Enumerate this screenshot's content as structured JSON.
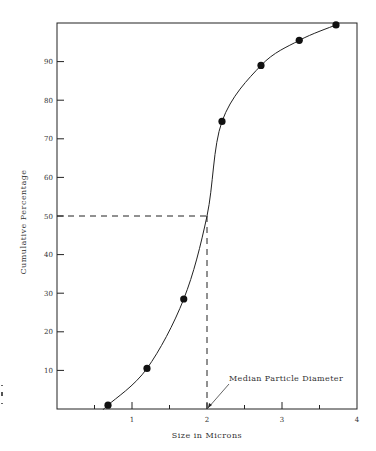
{
  "chart_data": {
    "type": "line",
    "title": "",
    "xlabel": "Size in Microns",
    "ylabel": "Cumulative Percentage",
    "xlim": [
      0,
      4
    ],
    "ylim": [
      0,
      100
    ],
    "x_ticks": [
      1,
      2,
      3,
      4
    ],
    "x_minor_ticks": [
      0.5,
      1.5,
      2.5,
      3.5
    ],
    "y_ticks": [
      10,
      20,
      30,
      40,
      50,
      60,
      70,
      80,
      90
    ],
    "grid": false,
    "legend": null,
    "series": [
      {
        "name": "Cumulative distribution",
        "style": "smooth curve with filled circle markers",
        "x": [
          0.68,
          1.2,
          1.69,
          2.2,
          2.72,
          3.23,
          3.72
        ],
        "y": [
          1,
          10.5,
          28.5,
          74.5,
          89,
          95.5,
          99.5
        ]
      }
    ],
    "reference_lines": [
      {
        "type": "horizontal-dashed",
        "y": 50,
        "x_from": 0,
        "x_to": 2
      },
      {
        "type": "vertical-dashed",
        "x": 2,
        "y_from": 0,
        "y_to": 50
      }
    ],
    "annotations": [
      {
        "text": "Median Particle Diameter",
        "points_to": {
          "x": 2,
          "y": 0
        }
      }
    ]
  },
  "labels": {
    "xlabel": "Size in Microns",
    "ylabel": "Cumulative Percentage",
    "annotation": "Median Particle Diameter",
    "xticks": [
      "1",
      "2",
      "3",
      "4"
    ],
    "yticks": [
      "10",
      "20",
      "30",
      "40",
      "50",
      "60",
      "70",
      "80",
      "90"
    ]
  }
}
